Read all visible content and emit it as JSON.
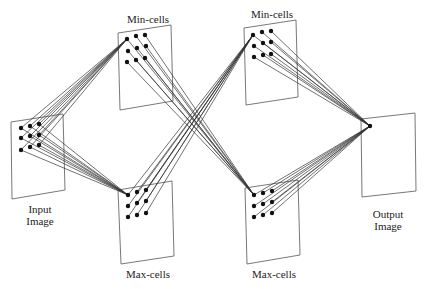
{
  "labels": {
    "input": "Input\nImage",
    "min1": "Min-cells",
    "min2": "Min-cells",
    "max1": "Max-cells",
    "max2": "Max-cells",
    "output": "Output\nImage"
  },
  "colors": {
    "line": "#333333",
    "dot": "#111111",
    "panel_border": "#555555",
    "background": "#ffffff"
  },
  "panels": [
    {
      "id": "input",
      "points": [
        [
          11,
          122
        ],
        [
          63,
          114
        ],
        [
          65,
          190
        ],
        [
          12,
          199
        ]
      ]
    },
    {
      "id": "min1",
      "points": [
        [
          118,
          33
        ],
        [
          171,
          25
        ],
        [
          173,
          101
        ],
        [
          120,
          110
        ]
      ]
    },
    {
      "id": "max1",
      "points": [
        [
          118,
          190
        ],
        [
          172,
          181
        ],
        [
          174,
          256
        ],
        [
          121,
          264
        ]
      ]
    },
    {
      "id": "min2",
      "points": [
        [
          244,
          28
        ],
        [
          296,
          20
        ],
        [
          298,
          97
        ],
        [
          246,
          105
        ]
      ]
    },
    {
      "id": "max2",
      "points": [
        [
          245,
          188
        ],
        [
          298,
          180
        ],
        [
          300,
          255
        ],
        [
          247,
          264
        ]
      ]
    },
    {
      "id": "output",
      "points": [
        [
          361,
          119
        ],
        [
          415,
          113
        ],
        [
          416,
          191
        ],
        [
          362,
          197
        ]
      ]
    }
  ],
  "dots": {
    "input": [
      [
        21,
        128
      ],
      [
        30,
        126
      ],
      [
        39,
        124
      ],
      [
        21,
        138
      ],
      [
        30,
        136
      ],
      [
        39,
        135
      ],
      [
        21,
        150
      ],
      [
        30,
        147
      ],
      [
        39,
        145
      ]
    ],
    "min1": [
      [
        127,
        39
      ],
      [
        136,
        36
      ],
      [
        145,
        35
      ],
      [
        128,
        51
      ],
      [
        137,
        48
      ],
      [
        146,
        46
      ],
      [
        127,
        62
      ],
      [
        136,
        60
      ],
      [
        145,
        58
      ]
    ],
    "max1": [
      [
        128,
        195
      ],
      [
        137,
        192
      ],
      [
        146,
        190
      ],
      [
        128,
        206
      ],
      [
        137,
        203
      ],
      [
        146,
        201
      ],
      [
        128,
        217
      ],
      [
        137,
        215
      ],
      [
        146,
        213
      ]
    ],
    "min2": [
      [
        253,
        35
      ],
      [
        262,
        32
      ],
      [
        271,
        31
      ],
      [
        254,
        46
      ],
      [
        263,
        43
      ],
      [
        271,
        42
      ],
      [
        254,
        57
      ],
      [
        263,
        55
      ],
      [
        271,
        54
      ]
    ],
    "max2": [
      [
        254,
        195
      ],
      [
        263,
        193
      ],
      [
        272,
        191
      ],
      [
        254,
        206
      ],
      [
        263,
        204
      ],
      [
        272,
        202
      ],
      [
        254,
        217
      ],
      [
        263,
        215
      ],
      [
        272,
        213
      ]
    ],
    "output": [
      [
        370,
        126
      ]
    ]
  },
  "connections": [
    {
      "from": "input",
      "to_dot": [
        127,
        39
      ]
    },
    {
      "from": "input",
      "to_dot": [
        128,
        195
      ]
    },
    {
      "from": "min1",
      "to_dot": [
        254,
        195
      ]
    },
    {
      "from": "max1",
      "to_dot": [
        253,
        35
      ]
    },
    {
      "from": "min2",
      "to_dot": [
        370,
        126
      ]
    },
    {
      "from": "max2",
      "to_dot": [
        370,
        126
      ]
    }
  ]
}
